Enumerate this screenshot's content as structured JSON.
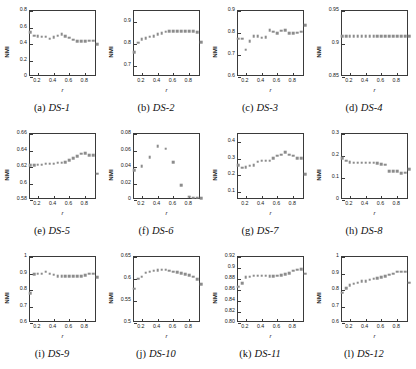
{
  "figure": {
    "panel_count": 12,
    "marker_color": "#8c8c8c",
    "axis_color": "#3a3a3a",
    "shared_xlabel": "r",
    "shared_ylabel": "NMI",
    "shared_xticks": [
      "0.2",
      "0.4",
      "0.6",
      "0.8"
    ],
    "shared_xlim": [
      0.1,
      0.95
    ]
  },
  "chart_data": [
    {
      "type": "scatter",
      "panel_letter": "(a)",
      "title": "DS-1",
      "xlabel": "r",
      "ylabel": "NMI",
      "x": [
        0.1,
        0.15,
        0.2,
        0.25,
        0.3,
        0.35,
        0.4,
        0.45,
        0.5,
        0.55,
        0.6,
        0.65,
        0.7,
        0.75,
        0.8,
        0.85,
        0.9,
        0.95
      ],
      "values": [
        0.545,
        0.5,
        0.495,
        0.49,
        0.49,
        0.465,
        0.485,
        0.5,
        0.52,
        0.495,
        0.475,
        0.45,
        0.435,
        0.435,
        0.435,
        0.44,
        0.44,
        0.395
      ],
      "xlim": [
        0.1,
        0.95
      ],
      "ylim": [
        0,
        0.8
      ],
      "yticks": [
        "0",
        "0.2",
        "0.4",
        "0.6",
        "0.8"
      ],
      "ytick_values": [
        0,
        0.2,
        0.4,
        0.6,
        0.8
      ],
      "xticks": [
        "0.2",
        "0.4",
        "0.6",
        "0.8"
      ],
      "xtick_values": [
        0.2,
        0.4,
        0.6,
        0.8
      ],
      "grid": false
    },
    {
      "type": "scatter",
      "panel_letter": "(b)",
      "title": "DS-2",
      "xlabel": "r",
      "ylabel": "NMI",
      "x": [
        0.1,
        0.15,
        0.2,
        0.25,
        0.3,
        0.35,
        0.4,
        0.45,
        0.5,
        0.55,
        0.6,
        0.65,
        0.7,
        0.75,
        0.8,
        0.85,
        0.9,
        0.95
      ],
      "values": [
        0.763,
        0.805,
        0.823,
        0.827,
        0.833,
        0.836,
        0.845,
        0.849,
        0.855,
        0.857,
        0.858,
        0.858,
        0.858,
        0.858,
        0.858,
        0.857,
        0.854,
        0.808
      ],
      "xlim": [
        0.1,
        0.95
      ],
      "ylim": [
        0.65,
        0.95
      ],
      "yticks": [
        "0.7",
        "0.8",
        "0.9"
      ],
      "ytick_values": [
        0.7,
        0.8,
        0.9
      ],
      "xticks": [
        "0.2",
        "0.4",
        "0.6",
        "0.8"
      ],
      "xtick_values": [
        0.2,
        0.4,
        0.6,
        0.8
      ],
      "grid": false
    },
    {
      "type": "scatter",
      "panel_letter": "(c)",
      "title": "DS-3",
      "xlabel": "r",
      "ylabel": "NMI",
      "x": [
        0.1,
        0.15,
        0.2,
        0.25,
        0.3,
        0.35,
        0.4,
        0.45,
        0.5,
        0.55,
        0.6,
        0.65,
        0.7,
        0.75,
        0.8,
        0.85,
        0.9,
        0.95
      ],
      "values": [
        0.775,
        0.775,
        0.725,
        0.762,
        0.785,
        0.785,
        0.778,
        0.782,
        0.812,
        0.805,
        0.8,
        0.81,
        0.812,
        0.8,
        0.8,
        0.802,
        0.805,
        0.835
      ],
      "xlim": [
        0.1,
        0.95
      ],
      "ylim": [
        0.6,
        0.9
      ],
      "yticks": [
        "0.6",
        "0.7",
        "0.8",
        "0.9"
      ],
      "ytick_values": [
        0.6,
        0.7,
        0.8,
        0.9
      ],
      "xticks": [
        "0.2",
        "0.4",
        "0.6",
        "0.8"
      ],
      "xtick_values": [
        0.2,
        0.4,
        0.6,
        0.8
      ],
      "grid": false
    },
    {
      "type": "scatter",
      "panel_letter": "(d)",
      "title": "DS-4",
      "xlabel": "r",
      "ylabel": "NMI",
      "x": [
        0.1,
        0.15,
        0.2,
        0.25,
        0.3,
        0.35,
        0.4,
        0.45,
        0.5,
        0.55,
        0.6,
        0.65,
        0.7,
        0.75,
        0.8,
        0.85,
        0.9,
        0.95
      ],
      "values": [
        0.912,
        0.912,
        0.912,
        0.912,
        0.912,
        0.912,
        0.912,
        0.912,
        0.912,
        0.912,
        0.912,
        0.912,
        0.912,
        0.912,
        0.912,
        0.912,
        0.912,
        0.912
      ],
      "xlim": [
        0.1,
        0.95
      ],
      "ylim": [
        0.85,
        0.95
      ],
      "yticks": [
        "0.85",
        "0.9",
        "0.95"
      ],
      "ytick_values": [
        0.85,
        0.9,
        0.95
      ],
      "xticks": [
        "0.2",
        "0.4",
        "0.6",
        "0.8"
      ],
      "xtick_values": [
        0.2,
        0.4,
        0.6,
        0.8
      ],
      "grid": false
    },
    {
      "type": "scatter",
      "panel_letter": "(e)",
      "title": "DS-5",
      "xlabel": "r",
      "ylabel": "NMI",
      "x": [
        0.1,
        0.15,
        0.2,
        0.25,
        0.3,
        0.35,
        0.4,
        0.45,
        0.5,
        0.55,
        0.6,
        0.65,
        0.7,
        0.75,
        0.8,
        0.85,
        0.9,
        0.95
      ],
      "values": [
        0.622,
        0.622,
        0.623,
        0.623,
        0.624,
        0.624,
        0.624,
        0.625,
        0.625,
        0.626,
        0.628,
        0.631,
        0.633,
        0.636,
        0.637,
        0.634,
        0.634,
        0.612
      ],
      "xlim": [
        0.1,
        0.95
      ],
      "ylim": [
        0.58,
        0.66
      ],
      "yticks": [
        "0.58",
        "0.6",
        "0.62",
        "0.64",
        "0.66"
      ],
      "ytick_values": [
        0.58,
        0.6,
        0.62,
        0.64,
        0.66
      ],
      "xticks": [
        "0.2",
        "0.4",
        "0.6",
        "0.8"
      ],
      "xtick_values": [
        0.2,
        0.4,
        0.6,
        0.8
      ],
      "grid": false
    },
    {
      "type": "scatter",
      "panel_letter": "(f)",
      "title": "DS-6",
      "xlabel": "r",
      "ylabel": "NMI",
      "x": [
        0.1,
        0.2,
        0.3,
        0.4,
        0.5,
        0.6,
        0.7,
        0.8,
        0.85,
        0.9,
        0.95
      ],
      "values": [
        0.036,
        0.041,
        0.052,
        0.065,
        0.062,
        0.046,
        0.018,
        0.004,
        0.003,
        0.003,
        0.002
      ],
      "xlim": [
        0.1,
        0.95
      ],
      "ylim": [
        0,
        0.08
      ],
      "yticks": [
        "0",
        "0.02",
        "0.04",
        "0.06",
        "0.08"
      ],
      "ytick_values": [
        0,
        0.02,
        0.04,
        0.06,
        0.08
      ],
      "xticks": [
        "0.2",
        "0.4",
        "0.6",
        "0.8"
      ],
      "xtick_values": [
        0.2,
        0.4,
        0.6,
        0.8
      ],
      "grid": false
    },
    {
      "type": "scatter",
      "panel_letter": "(g)",
      "title": "DS-7",
      "xlabel": "r",
      "ylabel": "NMI",
      "x": [
        0.1,
        0.15,
        0.2,
        0.25,
        0.3,
        0.35,
        0.4,
        0.45,
        0.5,
        0.55,
        0.6,
        0.65,
        0.7,
        0.75,
        0.8,
        0.85,
        0.9,
        0.95
      ],
      "values": [
        0.262,
        0.245,
        0.247,
        0.258,
        0.262,
        0.283,
        0.288,
        0.288,
        0.288,
        0.305,
        0.318,
        0.325,
        0.34,
        0.325,
        0.318,
        0.305,
        0.305,
        0.208
      ],
      "xlim": [
        0.1,
        0.95
      ],
      "ylim": [
        0.05,
        0.45
      ],
      "yticks": [
        "0.1",
        "0.2",
        "0.3",
        "0.4"
      ],
      "ytick_values": [
        0.1,
        0.2,
        0.3,
        0.4
      ],
      "xticks": [
        "0.2",
        "0.4",
        "0.6",
        "0.8"
      ],
      "xtick_values": [
        0.2,
        0.4,
        0.6,
        0.8
      ],
      "grid": false
    },
    {
      "type": "scatter",
      "panel_letter": "(h)",
      "title": "DS-8",
      "xlabel": "r",
      "ylabel": "NMI",
      "x": [
        0.1,
        0.15,
        0.2,
        0.25,
        0.3,
        0.35,
        0.4,
        0.45,
        0.5,
        0.55,
        0.6,
        0.65,
        0.7,
        0.75,
        0.8,
        0.85,
        0.9,
        0.95
      ],
      "values": [
        0.19,
        0.178,
        0.172,
        0.17,
        0.17,
        0.17,
        0.17,
        0.17,
        0.17,
        0.168,
        0.162,
        0.16,
        0.13,
        0.132,
        0.132,
        0.122,
        0.124,
        0.14
      ],
      "xlim": [
        0.1,
        0.95
      ],
      "ylim": [
        0,
        0.3
      ],
      "yticks": [
        "0",
        "0.1",
        "0.2",
        "0.3"
      ],
      "ytick_values": [
        0,
        0.1,
        0.2,
        0.3
      ],
      "xticks": [
        "0.2",
        "0.4",
        "0.6",
        "0.8"
      ],
      "xtick_values": [
        0.2,
        0.4,
        0.6,
        0.8
      ],
      "grid": false
    },
    {
      "type": "scatter",
      "panel_letter": "(i)",
      "title": "DS-9",
      "xlabel": "r",
      "ylabel": "NMI",
      "x": [
        0.1,
        0.15,
        0.2,
        0.25,
        0.3,
        0.35,
        0.4,
        0.45,
        0.5,
        0.55,
        0.6,
        0.65,
        0.7,
        0.75,
        0.8,
        0.85,
        0.9,
        0.95
      ],
      "values": [
        0.782,
        0.895,
        0.9,
        0.9,
        0.91,
        0.9,
        0.892,
        0.885,
        0.882,
        0.882,
        0.882,
        0.882,
        0.882,
        0.885,
        0.89,
        0.9,
        0.898,
        0.878
      ],
      "xlim": [
        0.1,
        0.95
      ],
      "ylim": [
        0.6,
        1.0
      ],
      "yticks": [
        "0.6",
        "0.7",
        "0.8",
        "0.9",
        "1"
      ],
      "ytick_values": [
        0.6,
        0.7,
        0.8,
        0.9,
        1.0
      ],
      "xticks": [
        "0.2",
        "0.4",
        "0.6",
        "0.8"
      ],
      "xtick_values": [
        0.2,
        0.4,
        0.6,
        0.8
      ],
      "grid": false
    },
    {
      "type": "scatter",
      "panel_letter": "(j)",
      "title": "DS-10",
      "xlabel": "r",
      "ylabel": "NMI",
      "x": [
        0.1,
        0.15,
        0.2,
        0.25,
        0.3,
        0.35,
        0.4,
        0.45,
        0.5,
        0.55,
        0.6,
        0.65,
        0.7,
        0.75,
        0.8,
        0.85,
        0.9,
        0.95
      ],
      "values": [
        0.578,
        0.601,
        0.605,
        0.614,
        0.617,
        0.619,
        0.62,
        0.621,
        0.621,
        0.619,
        0.617,
        0.615,
        0.613,
        0.611,
        0.609,
        0.605,
        0.6,
        0.588
      ],
      "xlim": [
        0.1,
        0.95
      ],
      "ylim": [
        0.5,
        0.65
      ],
      "yticks": [
        "0.5",
        "0.55",
        "0.6",
        "0.65"
      ],
      "ytick_values": [
        0.5,
        0.55,
        0.6,
        0.65
      ],
      "xticks": [
        "0.2",
        "0.4",
        "0.6",
        "0.8"
      ],
      "xtick_values": [
        0.2,
        0.4,
        0.6,
        0.8
      ],
      "grid": false
    },
    {
      "type": "scatter",
      "panel_letter": "(k)",
      "title": "DS-11",
      "xlabel": "r",
      "ylabel": "NMI",
      "x": [
        0.1,
        0.15,
        0.2,
        0.25,
        0.3,
        0.35,
        0.4,
        0.45,
        0.5,
        0.55,
        0.6,
        0.65,
        0.7,
        0.75,
        0.8,
        0.85,
        0.9,
        0.95
      ],
      "values": [
        0.866,
        0.872,
        0.883,
        0.884,
        0.886,
        0.886,
        0.886,
        0.886,
        0.885,
        0.885,
        0.886,
        0.887,
        0.889,
        0.891,
        0.895,
        0.897,
        0.898,
        0.89
      ],
      "xlim": [
        0.1,
        0.95
      ],
      "ylim": [
        0.8,
        0.92
      ],
      "yticks": [
        "0.80",
        "0.82",
        "0.84",
        "0.86",
        "0.88",
        "0.9",
        "0.92"
      ],
      "ytick_values": [
        0.8,
        0.82,
        0.84,
        0.86,
        0.88,
        0.9,
        0.92
      ],
      "xticks": [
        "0.2",
        "0.4",
        "0.6",
        "0.8"
      ],
      "xtick_values": [
        0.2,
        0.4,
        0.6,
        0.8
      ],
      "grid": false
    },
    {
      "type": "scatter",
      "panel_letter": "(l)",
      "title": "DS-12",
      "xlabel": "r",
      "ylabel": "NMI",
      "x": [
        0.1,
        0.15,
        0.2,
        0.25,
        0.3,
        0.35,
        0.4,
        0.45,
        0.5,
        0.55,
        0.6,
        0.65,
        0.7,
        0.75,
        0.8,
        0.85,
        0.9,
        0.95
      ],
      "values": [
        0.783,
        0.81,
        0.83,
        0.838,
        0.845,
        0.852,
        0.855,
        0.862,
        0.868,
        0.873,
        0.878,
        0.885,
        0.892,
        0.9,
        0.912,
        0.912,
        0.912,
        0.843
      ],
      "xlim": [
        0.1,
        0.95
      ],
      "ylim": [
        0.6,
        1.0
      ],
      "yticks": [
        "0.6",
        "0.7",
        "0.8",
        "0.9",
        "1"
      ],
      "ytick_values": [
        0.6,
        0.7,
        0.8,
        0.9,
        1.0
      ],
      "xticks": [
        "0.2",
        "0.4",
        "0.6",
        "0.8"
      ],
      "xtick_values": [
        0.2,
        0.4,
        0.6,
        0.8
      ],
      "grid": false
    }
  ]
}
